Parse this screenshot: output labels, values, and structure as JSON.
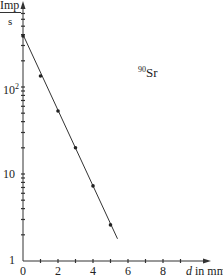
{
  "chart_data": {
    "type": "scatter",
    "title": "",
    "annotation": "⁹⁰Sr",
    "annotation_isotope_mass": "90",
    "annotation_element": "Sr",
    "xlabel": "d in mm",
    "xlabel_var": "d",
    "xlabel_unit": "in mm",
    "ylabel": "Imp/s",
    "ylabel_num": "Imp",
    "ylabel_den": "s",
    "yscale": "log",
    "xlim": [
      0,
      10
    ],
    "ylim": [
      1,
      1000
    ],
    "x_ticks": [
      0,
      1,
      2,
      3,
      4,
      5,
      6,
      7,
      8,
      9
    ],
    "x_tick_labels": [
      "0",
      "2",
      "4",
      "6",
      "8"
    ],
    "y_tick_labels": [
      "1",
      "10",
      "10²"
    ],
    "grid": false,
    "series": [
      {
        "name": "measured",
        "x": [
          0,
          1,
          2,
          3,
          4,
          5
        ],
        "y": [
          385,
          134,
          53,
          20,
          7.3,
          2.6
        ]
      },
      {
        "name": "fit line",
        "x": [
          0,
          5.4
        ],
        "y": [
          400,
          1.8
        ]
      }
    ]
  }
}
